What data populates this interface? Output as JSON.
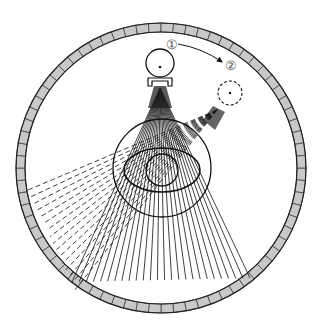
{
  "diagram": {
    "type": "CT scanner geometry schematic",
    "labels": {
      "position_1": "①",
      "position_2": "②"
    },
    "elements": {
      "detector_ring": {
        "cx": 161,
        "cy": 168,
        "r_outer": 145,
        "r_inner": 136,
        "segments": 72,
        "fill": "#c8c8c8",
        "stroke": "#333333"
      },
      "source_1": {
        "cx": 160,
        "cy": 63,
        "r": 14,
        "style": "solid"
      },
      "collimator_1": {
        "x": 148,
        "y": 78,
        "w": 24,
        "h": 8
      },
      "source_2": {
        "cx": 230,
        "cy": 93,
        "r": 12,
        "style": "dashed"
      },
      "fov_circle": {
        "cx": 162,
        "cy": 168,
        "r": 49
      },
      "body_ellipse": {
        "cx": 162,
        "cy": 170,
        "rx": 38,
        "ry": 22
      },
      "organ_circle": {
        "cx": 162,
        "cy": 170,
        "r": 16
      },
      "beam_1": {
        "apex": [
          160,
          88
        ],
        "left_end": [
          72,
          282
        ],
        "right_end": [
          250,
          278
        ],
        "rays": 26,
        "style": "solid"
      },
      "beam_2": {
        "apex": [
          217,
          110
        ],
        "left_end": [
          28,
          190
        ],
        "right_end": [
          75,
          290
        ],
        "rays": 16,
        "style": "dashed"
      },
      "rotation_arrow": {
        "from": [
          178,
          44
        ],
        "to": [
          222,
          62
        ]
      }
    }
  }
}
